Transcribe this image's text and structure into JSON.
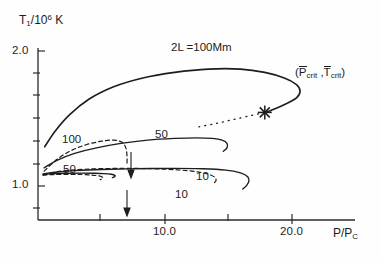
{
  "figure": {
    "background_color": "#fefefe",
    "line_color": "#1d1d1d"
  },
  "axes": {
    "y_title_prefix": "T",
    "y_title_sub": "1",
    "y_title_mid": "/10",
    "y_title_sup": "6",
    "y_title_suffix": "K",
    "y_title_full": "T1/10^6 K",
    "x_title_prefix": "P/P",
    "x_title_sub": "C",
    "x_title_full": "P/PC",
    "y_ticks_major": [
      "2.0",
      "1.0"
    ],
    "x_ticks_major": [
      "10.0",
      "20.0"
    ],
    "x_range": [
      0,
      26
    ],
    "y_range": [
      0.55,
      2.1
    ]
  },
  "annotations": {
    "top_curve_label": "2L =100Mm",
    "crit_open_paren": "(",
    "crit_p_symbol": "P",
    "crit_p_sub": "crit",
    "crit_separator": ",",
    "crit_t_symbol": "T",
    "crit_t_sub": "crit",
    "crit_close_paren": ")",
    "crit_full": "(Pcrit , Tcrit)"
  },
  "curve_labels": {
    "solid_100": "100",
    "solid_50": "50",
    "dashed_50": "50",
    "solid_10": "10",
    "dashed_10": "10"
  },
  "chart_data": {
    "type": "line",
    "title": "",
    "xlabel": "P/PC",
    "ylabel": "T1/10^6 K",
    "xlim": [
      0,
      26
    ],
    "ylim": [
      0.55,
      2.1
    ],
    "grid": false,
    "legend": "inline-curve-labels",
    "x_tick_values": [
      5.0,
      10.0,
      15.0,
      20.0
    ],
    "x_tick_labels": [
      "",
      "10.0",
      "",
      "20.0"
    ],
    "y_tick_values": [
      0.8,
      1.0,
      1.2,
      1.4,
      1.6,
      1.8,
      2.0
    ],
    "y_tick_labels": [
      "",
      "1.0",
      "",
      "",
      "",
      "",
      "2.0"
    ],
    "marker": {
      "symbol": "asterisk",
      "label": "(Pcrit , Tcrit)",
      "x": 18.6,
      "y": 1.52
    },
    "series": [
      {
        "name": "2L =100Mm",
        "style": "solid",
        "label": "2L =100Mm",
        "points": [
          [
            0.55,
            1.21
          ],
          [
            1.4,
            1.35
          ],
          [
            2.6,
            1.5
          ],
          [
            4.2,
            1.64
          ],
          [
            6.2,
            1.75
          ],
          [
            8.6,
            1.83
          ],
          [
            11.2,
            1.88
          ],
          [
            14.0,
            1.91
          ],
          [
            16.6,
            1.91
          ],
          [
            18.6,
            1.88
          ],
          [
            20.2,
            1.83
          ],
          [
            21.2,
            1.77
          ],
          [
            21.5,
            1.71
          ],
          [
            21.2,
            1.65
          ],
          [
            20.4,
            1.6
          ],
          [
            19.4,
            1.55
          ],
          [
            18.7,
            1.52
          ]
        ]
      },
      {
        "name": "100 solid",
        "style": "solid",
        "label": "100",
        "points": [
          [
            0.5,
            1.02
          ],
          [
            1.6,
            1.09
          ],
          [
            3.0,
            1.15
          ],
          [
            4.8,
            1.2
          ],
          [
            6.8,
            1.24
          ],
          [
            9.0,
            1.27
          ],
          [
            11.2,
            1.285
          ],
          [
            13.0,
            1.29
          ],
          [
            14.3,
            1.285
          ],
          [
            15.1,
            1.27
          ],
          [
            15.5,
            1.24
          ],
          [
            15.5,
            1.2
          ],
          [
            15.2,
            1.17
          ]
        ]
      },
      {
        "name": "100 dashed",
        "style": "dashed",
        "label": "100",
        "points": [
          [
            0.5,
            0.99
          ],
          [
            1.6,
            1.1
          ],
          [
            2.8,
            1.18
          ],
          [
            4.0,
            1.23
          ],
          [
            5.2,
            1.26
          ],
          [
            6.2,
            1.27
          ],
          [
            6.9,
            1.25
          ],
          [
            7.2,
            1.2
          ],
          [
            7.3,
            1.13
          ],
          [
            7.3,
            1.06
          ]
        ]
      },
      {
        "name": "50 solid",
        "style": "solid",
        "label": "50",
        "points": [
          [
            0.45,
            0.965
          ],
          [
            1.4,
            0.98
          ],
          [
            3.0,
            0.995
          ],
          [
            5.2,
            1.005
          ],
          [
            8.0,
            1.012
          ],
          [
            11.0,
            1.015
          ],
          [
            13.5,
            1.012
          ],
          [
            15.4,
            1.0
          ],
          [
            16.6,
            0.975
          ],
          [
            17.2,
            0.94
          ],
          [
            17.3,
            0.9
          ],
          [
            17.1,
            0.86
          ],
          [
            16.8,
            0.83
          ]
        ]
      },
      {
        "name": "50 dashed",
        "style": "dashed",
        "label": "50",
        "points": [
          [
            0.45,
            0.955
          ],
          [
            1.6,
            0.985
          ],
          [
            3.2,
            1.003
          ],
          [
            5.0,
            1.012
          ],
          [
            7.2,
            1.015
          ],
          [
            9.4,
            1.012
          ],
          [
            11.4,
            1.002
          ],
          [
            13.0,
            0.985
          ],
          [
            14.0,
            0.962
          ],
          [
            14.5,
            0.935
          ],
          [
            14.6,
            0.905
          ],
          [
            14.4,
            0.88
          ]
        ]
      },
      {
        "name": "10 solid",
        "style": "solid",
        "label": "10",
        "points": [
          [
            0.4,
            0.962
          ],
          [
            1.2,
            0.968
          ],
          [
            2.4,
            0.972
          ],
          [
            3.6,
            0.973
          ],
          [
            4.6,
            0.972
          ],
          [
            5.4,
            0.968
          ],
          [
            6.0,
            0.962
          ],
          [
            6.3,
            0.953
          ],
          [
            6.3,
            0.942
          ],
          [
            6.1,
            0.932
          ]
        ]
      },
      {
        "name": "10 dashed",
        "style": "dashed",
        "label": "10",
        "points": [
          [
            0.4,
            0.955
          ],
          [
            1.4,
            0.96
          ],
          [
            2.6,
            0.962
          ],
          [
            3.6,
            0.96
          ],
          [
            4.4,
            0.955
          ],
          [
            5.0,
            0.947
          ],
          [
            5.3,
            0.936
          ],
          [
            5.3,
            0.924
          ],
          [
            5.1,
            0.914
          ]
        ]
      }
    ]
  }
}
